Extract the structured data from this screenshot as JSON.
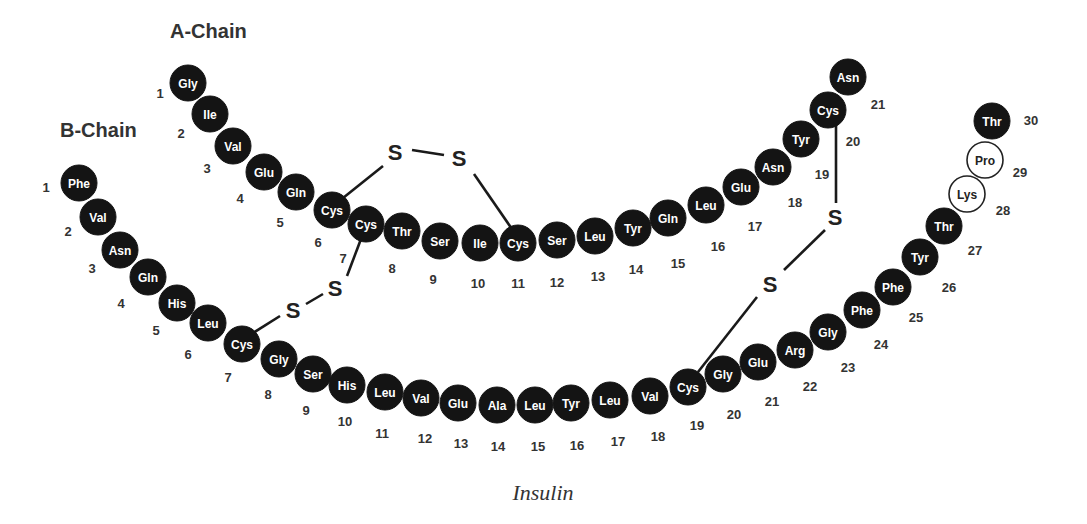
{
  "figure": {
    "caption": "Insulin",
    "residue_radius": 18
  },
  "chains": [
    {
      "id": "A",
      "title": "A-Chain",
      "title_pos": [
        170,
        38
      ],
      "residues": [
        {
          "n": 1,
          "aa": "Gly",
          "x": 188,
          "y": 83,
          "lx": 160,
          "ly": 93,
          "style": "filled"
        },
        {
          "n": 2,
          "aa": "Ile",
          "x": 210,
          "y": 114,
          "lx": 181,
          "ly": 133,
          "style": "filled"
        },
        {
          "n": 3,
          "aa": "Val",
          "x": 233,
          "y": 146,
          "lx": 207,
          "ly": 168,
          "style": "filled"
        },
        {
          "n": 4,
          "aa": "Glu",
          "x": 264,
          "y": 172,
          "lx": 240,
          "ly": 198,
          "style": "filled"
        },
        {
          "n": 5,
          "aa": "Gln",
          "x": 296,
          "y": 192,
          "lx": 280,
          "ly": 222,
          "style": "filled"
        },
        {
          "n": 6,
          "aa": "Cys",
          "x": 332,
          "y": 210,
          "lx": 318,
          "ly": 242,
          "style": "filled"
        },
        {
          "n": 7,
          "aa": "Cys",
          "x": 366,
          "y": 224,
          "lx": 343,
          "ly": 258,
          "style": "filled"
        },
        {
          "n": 8,
          "aa": "Thr",
          "x": 402,
          "y": 231,
          "lx": 392,
          "ly": 268,
          "style": "filled"
        },
        {
          "n": 9,
          "aa": "Ser",
          "x": 440,
          "y": 241,
          "lx": 433,
          "ly": 279,
          "style": "filled"
        },
        {
          "n": 10,
          "aa": "Ile",
          "x": 480,
          "y": 243,
          "lx": 478,
          "ly": 283,
          "style": "filled"
        },
        {
          "n": 11,
          "aa": "Cys",
          "x": 518,
          "y": 243,
          "lx": 518,
          "ly": 283,
          "style": "filled"
        },
        {
          "n": 12,
          "aa": "Ser",
          "x": 557,
          "y": 240,
          "lx": 557,
          "ly": 282,
          "style": "filled"
        },
        {
          "n": 13,
          "aa": "Leu",
          "x": 595,
          "y": 236,
          "lx": 598,
          "ly": 276,
          "style": "filled"
        },
        {
          "n": 14,
          "aa": "Tyr",
          "x": 633,
          "y": 228,
          "lx": 636,
          "ly": 269,
          "style": "filled"
        },
        {
          "n": 15,
          "aa": "Gln",
          "x": 668,
          "y": 218,
          "lx": 678,
          "ly": 263,
          "style": "filled"
        },
        {
          "n": 16,
          "aa": "Leu",
          "x": 706,
          "y": 205,
          "lx": 718,
          "ly": 246,
          "style": "filled"
        },
        {
          "n": 17,
          "aa": "Glu",
          "x": 741,
          "y": 187,
          "lx": 755,
          "ly": 226,
          "style": "filled"
        },
        {
          "n": 18,
          "aa": "Asn",
          "x": 773,
          "y": 167,
          "lx": 795,
          "ly": 202,
          "style": "filled"
        },
        {
          "n": 19,
          "aa": "Tyr",
          "x": 801,
          "y": 139,
          "lx": 822,
          "ly": 174,
          "style": "filled"
        },
        {
          "n": 20,
          "aa": "Cys",
          "x": 828,
          "y": 110,
          "lx": 853,
          "ly": 141,
          "style": "filled"
        },
        {
          "n": 21,
          "aa": "Asn",
          "x": 848,
          "y": 77,
          "lx": 878,
          "ly": 104,
          "style": "filled"
        }
      ]
    },
    {
      "id": "B",
      "title": "B-Chain",
      "title_pos": [
        60,
        137
      ],
      "residues": [
        {
          "n": 1,
          "aa": "Phe",
          "x": 79,
          "y": 183,
          "lx": 46,
          "ly": 187,
          "style": "filled"
        },
        {
          "n": 2,
          "aa": "Val",
          "x": 98,
          "y": 217,
          "lx": 68,
          "ly": 231,
          "style": "filled"
        },
        {
          "n": 3,
          "aa": "Asn",
          "x": 120,
          "y": 250,
          "lx": 92,
          "ly": 268,
          "style": "filled"
        },
        {
          "n": 4,
          "aa": "Gln",
          "x": 148,
          "y": 277,
          "lx": 121,
          "ly": 303,
          "style": "filled"
        },
        {
          "n": 5,
          "aa": "His",
          "x": 177,
          "y": 303,
          "lx": 156,
          "ly": 330,
          "style": "filled"
        },
        {
          "n": 6,
          "aa": "Leu",
          "x": 208,
          "y": 323,
          "lx": 188,
          "ly": 354,
          "style": "filled"
        },
        {
          "n": 7,
          "aa": "Cys",
          "x": 242,
          "y": 344,
          "lx": 228,
          "ly": 377,
          "style": "filled"
        },
        {
          "n": 8,
          "aa": "Gly",
          "x": 279,
          "y": 359,
          "lx": 268,
          "ly": 394,
          "style": "filled"
        },
        {
          "n": 9,
          "aa": "Ser",
          "x": 313,
          "y": 374,
          "lx": 306,
          "ly": 410,
          "style": "filled"
        },
        {
          "n": 10,
          "aa": "His",
          "x": 347,
          "y": 385,
          "lx": 345,
          "ly": 421,
          "style": "filled"
        },
        {
          "n": 11,
          "aa": "Leu",
          "x": 385,
          "y": 392,
          "lx": 382,
          "ly": 433,
          "style": "filled"
        },
        {
          "n": 12,
          "aa": "Val",
          "x": 421,
          "y": 398,
          "lx": 425,
          "ly": 438,
          "style": "filled"
        },
        {
          "n": 13,
          "aa": "Glu",
          "x": 458,
          "y": 403,
          "lx": 461,
          "ly": 443,
          "style": "filled"
        },
        {
          "n": 14,
          "aa": "Ala",
          "x": 497,
          "y": 405,
          "lx": 498,
          "ly": 446,
          "style": "filled"
        },
        {
          "n": 15,
          "aa": "Leu",
          "x": 535,
          "y": 405,
          "lx": 538,
          "ly": 446,
          "style": "filled"
        },
        {
          "n": 16,
          "aa": "Tyr",
          "x": 571,
          "y": 403,
          "lx": 577,
          "ly": 445,
          "style": "filled"
        },
        {
          "n": 17,
          "aa": "Leu",
          "x": 610,
          "y": 400,
          "lx": 618,
          "ly": 441,
          "style": "filled"
        },
        {
          "n": 18,
          "aa": "Val",
          "x": 650,
          "y": 396,
          "lx": 658,
          "ly": 436,
          "style": "filled"
        },
        {
          "n": 19,
          "aa": "Cys",
          "x": 688,
          "y": 387,
          "lx": 697,
          "ly": 425,
          "style": "filled"
        },
        {
          "n": 20,
          "aa": "Gly",
          "x": 723,
          "y": 374,
          "lx": 734,
          "ly": 414,
          "style": "filled"
        },
        {
          "n": 21,
          "aa": "Glu",
          "x": 758,
          "y": 362,
          "lx": 772,
          "ly": 401,
          "style": "filled"
        },
        {
          "n": 22,
          "aa": "Arg",
          "x": 795,
          "y": 350,
          "lx": 810,
          "ly": 386,
          "style": "filled"
        },
        {
          "n": 23,
          "aa": "Gly",
          "x": 828,
          "y": 332,
          "lx": 848,
          "ly": 367,
          "style": "filled"
        },
        {
          "n": 24,
          "aa": "Phe",
          "x": 862,
          "y": 310,
          "lx": 881,
          "ly": 344,
          "style": "filled"
        },
        {
          "n": 25,
          "aa": "Phe",
          "x": 893,
          "y": 287,
          "lx": 916,
          "ly": 317,
          "style": "filled"
        },
        {
          "n": 26,
          "aa": "Tyr",
          "x": 920,
          "y": 257,
          "lx": 949,
          "ly": 287,
          "style": "filled"
        },
        {
          "n": 27,
          "aa": "Thr",
          "x": 944,
          "y": 226,
          "lx": 975,
          "ly": 250,
          "style": "filled"
        },
        {
          "n": 28,
          "aa": "Lys",
          "x": 967,
          "y": 194,
          "lx": 1003,
          "ly": 210,
          "style": "open"
        },
        {
          "n": 29,
          "aa": "Pro",
          "x": 985,
          "y": 160,
          "lx": 1020,
          "ly": 172,
          "style": "open"
        },
        {
          "n": 30,
          "aa": "Thr",
          "x": 992,
          "y": 121,
          "lx": 1031,
          "ly": 120,
          "style": "filled"
        }
      ]
    }
  ],
  "disulfide_bonds": [
    {
      "name": "A6-A11 intrachain",
      "sulfurs": [
        {
          "label": "S",
          "x": 395,
          "y": 152
        },
        {
          "label": "S",
          "x": 459,
          "y": 158
        }
      ],
      "segments": [
        [
          343,
          198,
          383,
          166
        ],
        [
          412,
          150,
          444,
          155
        ],
        [
          474,
          174,
          512,
          229
        ]
      ]
    },
    {
      "name": "A7-B7 interchain",
      "sulfurs": [
        {
          "label": "S",
          "x": 335,
          "y": 288
        },
        {
          "label": "S",
          "x": 293,
          "y": 310
        }
      ],
      "segments": [
        [
          361,
          239,
          347,
          276
        ],
        [
          306,
          304,
          323,
          294
        ],
        [
          280,
          316,
          253,
          333
        ]
      ]
    },
    {
      "name": "A20-B19 interchain",
      "sulfurs": [
        {
          "label": "S",
          "x": 835,
          "y": 217
        },
        {
          "label": "S",
          "x": 770,
          "y": 284
        }
      ],
      "segments": [
        [
          836,
          125,
          836,
          203
        ],
        [
          825,
          230,
          784,
          270
        ],
        [
          757,
          297,
          698,
          372
        ]
      ]
    }
  ]
}
